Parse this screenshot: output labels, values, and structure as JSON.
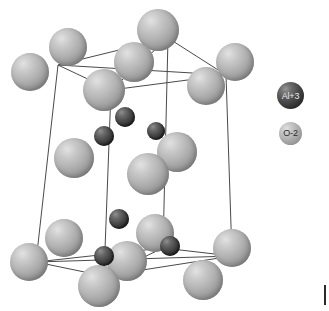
{
  "figure": {
    "type": "crystal-structure-diagram",
    "background_color": "#ffffff",
    "cell_line_color": "#4a4a4a"
  },
  "legend": {
    "items": [
      {
        "id": "aluminium",
        "label": "Al+3",
        "color": "#333333",
        "radius": 13.5,
        "label_color": "#e8e8e8"
      },
      {
        "id": "oxygen",
        "label": "O-2",
        "color": "#b2b2b2",
        "radius": 11.5,
        "label_color": "#2b2b2b"
      }
    ]
  },
  "cell_edges": [
    {
      "name": "top-front-left",
      "x1": 58,
      "y1": 65,
      "x2": 111,
      "y2": 90
    },
    {
      "name": "top-front-right",
      "x1": 111,
      "y1": 90,
      "x2": 226,
      "y2": 75
    },
    {
      "name": "top-back-left",
      "x1": 58,
      "y1": 65,
      "x2": 168,
      "y2": 38
    },
    {
      "name": "top-back-right",
      "x1": 168,
      "y1": 38,
      "x2": 226,
      "y2": 75
    },
    {
      "name": "top-diag-a",
      "x1": 58,
      "y1": 65,
      "x2": 226,
      "y2": 75
    },
    {
      "name": "top-diag-b",
      "x1": 111,
      "y1": 90,
      "x2": 168,
      "y2": 38
    },
    {
      "name": "vert-left-front",
      "x1": 58,
      "y1": 65,
      "x2": 36,
      "y2": 262
    },
    {
      "name": "vert-mid-front",
      "x1": 111,
      "y1": 90,
      "x2": 104,
      "y2": 276
    },
    {
      "name": "vert-back",
      "x1": 168,
      "y1": 38,
      "x2": 163,
      "y2": 248
    },
    {
      "name": "vert-right",
      "x1": 226,
      "y1": 75,
      "x2": 232,
      "y2": 256
    },
    {
      "name": "bot-front-left",
      "x1": 36,
      "y1": 262,
      "x2": 104,
      "y2": 276
    },
    {
      "name": "bot-front-right",
      "x1": 104,
      "y1": 276,
      "x2": 232,
      "y2": 256
    },
    {
      "name": "bot-back-left",
      "x1": 36,
      "y1": 262,
      "x2": 163,
      "y2": 248
    },
    {
      "name": "bot-back-right",
      "x1": 163,
      "y1": 248,
      "x2": 232,
      "y2": 256
    },
    {
      "name": "bot-diag-a",
      "x1": 36,
      "y1": 262,
      "x2": 232,
      "y2": 256
    },
    {
      "name": "bot-diag-b",
      "x1": 104,
      "y1": 276,
      "x2": 163,
      "y2": 248
    }
  ],
  "atoms": [
    {
      "id": "o-top-corner-left",
      "species": "oxygen",
      "cx": 30,
      "cy": 72,
      "r": 19,
      "z": 4
    },
    {
      "id": "o-top-corner-frontmid",
      "species": "oxygen",
      "cx": 68,
      "cy": 47,
      "r": 19,
      "z": 6
    },
    {
      "id": "o-top-corner-back",
      "species": "oxygen",
      "cx": 158,
      "cy": 30,
      "r": 21,
      "z": 7
    },
    {
      "id": "o-top-corner-right",
      "species": "oxygen",
      "cx": 235,
      "cy": 62,
      "r": 19,
      "z": 5
    },
    {
      "id": "o-top-face-center",
      "species": "oxygen",
      "cx": 134,
      "cy": 62,
      "r": 20,
      "z": 8
    },
    {
      "id": "o-top-edge-front",
      "species": "oxygen",
      "cx": 104,
      "cy": 90,
      "r": 21,
      "z": 9
    },
    {
      "id": "o-top-edge-right",
      "species": "oxygen",
      "cx": 206,
      "cy": 86,
      "r": 19,
      "z": 6
    },
    {
      "id": "al-upper-center",
      "species": "aluminium",
      "cx": 125,
      "cy": 117,
      "r": 10,
      "z": 12
    },
    {
      "id": "al-upper-left",
      "species": "aluminium",
      "cx": 104,
      "cy": 136,
      "r": 10,
      "z": 12
    },
    {
      "id": "al-upper-right",
      "species": "aluminium",
      "cx": 156,
      "cy": 131,
      "r": 9,
      "z": 12
    },
    {
      "id": "o-mid-left",
      "species": "oxygen",
      "cx": 74,
      "cy": 158,
      "r": 20,
      "z": 10
    },
    {
      "id": "o-mid-right",
      "species": "oxygen",
      "cx": 177,
      "cy": 152,
      "r": 20,
      "z": 10
    },
    {
      "id": "o-mid-center",
      "species": "oxygen",
      "cx": 148,
      "cy": 174,
      "r": 21,
      "z": 11
    },
    {
      "id": "al-lower-center",
      "species": "aluminium",
      "cx": 119,
      "cy": 219,
      "r": 10,
      "z": 12
    },
    {
      "id": "al-lower-left",
      "species": "aluminium",
      "cx": 104,
      "cy": 256,
      "r": 10,
      "z": 13
    },
    {
      "id": "al-lower-right",
      "species": "aluminium",
      "cx": 170,
      "cy": 246,
      "r": 10,
      "z": 13
    },
    {
      "id": "o-bot-corner-left",
      "species": "oxygen",
      "cx": 29,
      "cy": 262,
      "r": 19,
      "z": 3
    },
    {
      "id": "o-bot-corner-frontmid",
      "species": "oxygen",
      "cx": 64,
      "cy": 238,
      "r": 19,
      "z": 3
    },
    {
      "id": "o-bot-corner-back",
      "species": "oxygen",
      "cx": 155,
      "cy": 233,
      "r": 19,
      "z": 3
    },
    {
      "id": "o-bot-corner-right",
      "species": "oxygen",
      "cx": 232,
      "cy": 248,
      "r": 19,
      "z": 3
    },
    {
      "id": "o-bot-face-center",
      "species": "oxygen",
      "cx": 127,
      "cy": 261,
      "r": 20,
      "z": 4
    },
    {
      "id": "o-bot-edge-front",
      "species": "oxygen",
      "cx": 99,
      "cy": 286,
      "r": 21,
      "z": 5
    },
    {
      "id": "o-bot-edge-right",
      "species": "oxygen",
      "cx": 203,
      "cy": 280,
      "r": 20,
      "z": 5
    }
  ]
}
